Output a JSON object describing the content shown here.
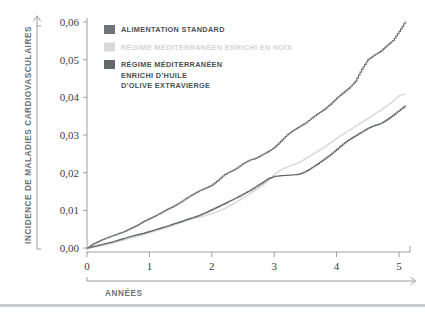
{
  "figure": {
    "background_color": "#ffffff",
    "footer_rule_color": "#c9ccd0"
  },
  "chart_data": {
    "type": "line",
    "title": "",
    "subtitle": "",
    "xlabel": "Années",
    "ylabel": "Incidence de maladies cardiovasculaires",
    "xlim": [
      0,
      5.15
    ],
    "ylim": [
      0,
      0.06
    ],
    "xticks": [
      "0",
      "1",
      "2",
      "3",
      "4",
      "5"
    ],
    "xtick_values": [
      0,
      1,
      2,
      3,
      4,
      5
    ],
    "yticks": [
      "0,00",
      "0,01",
      "0,02",
      "0,03",
      "0,04",
      "0,05",
      "0,06"
    ],
    "ytick_values": [
      0,
      0.01,
      0.02,
      0.03,
      0.04,
      0.05,
      0.06
    ],
    "grid": false,
    "legend_position": "top-left",
    "step_type": "post",
    "series": [
      {
        "name": "Alimentation standard",
        "color": "#6f7478",
        "swatch_color": "#6f7478",
        "x": [
          0,
          0.1,
          0.2,
          0.3,
          0.4,
          0.5,
          0.6,
          0.7,
          0.8,
          0.9,
          1.0,
          1.1,
          1.2,
          1.3,
          1.4,
          1.5,
          1.6,
          1.7,
          1.8,
          1.9,
          2.0,
          2.1,
          2.2,
          2.3,
          2.4,
          2.5,
          2.6,
          2.7,
          2.8,
          2.9,
          3.0,
          3.1,
          3.2,
          3.3,
          3.4,
          3.5,
          3.6,
          3.7,
          3.8,
          3.9,
          4.0,
          4.1,
          4.2,
          4.3,
          4.4,
          4.5,
          4.6,
          4.7,
          4.8,
          4.9,
          5.0,
          5.1
        ],
        "y": [
          0.0,
          0.0011,
          0.0019,
          0.0026,
          0.0032,
          0.0038,
          0.0044,
          0.0052,
          0.006,
          0.007,
          0.0078,
          0.0086,
          0.0095,
          0.0104,
          0.0112,
          0.0122,
          0.0133,
          0.0143,
          0.0152,
          0.0159,
          0.0167,
          0.018,
          0.0195,
          0.0203,
          0.0212,
          0.0224,
          0.0233,
          0.0238,
          0.0247,
          0.0256,
          0.0267,
          0.0283,
          0.03,
          0.0312,
          0.0322,
          0.0332,
          0.0345,
          0.0357,
          0.0368,
          0.0382,
          0.0398,
          0.0412,
          0.0425,
          0.0443,
          0.0475,
          0.05,
          0.0512,
          0.0522,
          0.0537,
          0.0551,
          0.0575,
          0.0602
        ]
      },
      {
        "name": "Régime méditerranéen enrichi en noix",
        "color": "#d7d9db",
        "swatch_color": "#d7d9db",
        "x": [
          0,
          0.1,
          0.2,
          0.3,
          0.4,
          0.5,
          0.6,
          0.7,
          0.8,
          0.9,
          1.0,
          1.1,
          1.2,
          1.3,
          1.4,
          1.5,
          1.6,
          1.7,
          1.8,
          1.9,
          2.0,
          2.1,
          2.2,
          2.3,
          2.4,
          2.5,
          2.6,
          2.7,
          2.8,
          2.9,
          3.0,
          3.1,
          3.2,
          3.3,
          3.4,
          3.5,
          3.6,
          3.7,
          3.8,
          3.9,
          4.0,
          4.1,
          4.2,
          4.3,
          4.4,
          4.5,
          4.6,
          4.7,
          4.8,
          4.9,
          5.0,
          5.1
        ],
        "y": [
          0.0,
          0.0002,
          0.0005,
          0.0009,
          0.0013,
          0.0018,
          0.0022,
          0.0027,
          0.0031,
          0.0036,
          0.0041,
          0.0046,
          0.0051,
          0.0056,
          0.0062,
          0.0068,
          0.0073,
          0.0078,
          0.0082,
          0.0087,
          0.0092,
          0.0098,
          0.0105,
          0.0114,
          0.0124,
          0.0134,
          0.0144,
          0.0155,
          0.0167,
          0.018,
          0.0196,
          0.0208,
          0.0215,
          0.0221,
          0.0228,
          0.0238,
          0.0248,
          0.0258,
          0.0268,
          0.028,
          0.0292,
          0.0303,
          0.0313,
          0.0324,
          0.0334,
          0.0345,
          0.0356,
          0.0366,
          0.0378,
          0.039,
          0.0405,
          0.041
        ]
      },
      {
        "name": "Régime méditerranéen enrichi d'huile d'olive extravierge",
        "color": "#63686d",
        "swatch_color": "#63686d",
        "x": [
          0,
          0.1,
          0.2,
          0.3,
          0.4,
          0.5,
          0.6,
          0.7,
          0.8,
          0.9,
          1.0,
          1.1,
          1.2,
          1.3,
          1.4,
          1.5,
          1.6,
          1.7,
          1.8,
          1.9,
          2.0,
          2.1,
          2.2,
          2.3,
          2.4,
          2.5,
          2.6,
          2.7,
          2.8,
          2.9,
          3.0,
          3.1,
          3.2,
          3.3,
          3.4,
          3.5,
          3.6,
          3.7,
          3.8,
          3.9,
          4.0,
          4.1,
          4.2,
          4.3,
          4.4,
          4.5,
          4.6,
          4.7,
          4.8,
          4.9,
          5.0,
          5.1
        ],
        "y": [
          0.0,
          0.0004,
          0.0008,
          0.0012,
          0.0016,
          0.0021,
          0.0026,
          0.0031,
          0.0035,
          0.0039,
          0.0044,
          0.0049,
          0.0054,
          0.0059,
          0.0065,
          0.007,
          0.0076,
          0.0081,
          0.0087,
          0.0094,
          0.0102,
          0.011,
          0.0118,
          0.0126,
          0.0134,
          0.0143,
          0.0152,
          0.0162,
          0.0173,
          0.0184,
          0.019,
          0.0192,
          0.0193,
          0.0194,
          0.0196,
          0.0203,
          0.0213,
          0.0224,
          0.0236,
          0.0248,
          0.0262,
          0.0276,
          0.0288,
          0.0298,
          0.0308,
          0.0318,
          0.0325,
          0.033,
          0.034,
          0.0352,
          0.0365,
          0.0378
        ]
      }
    ]
  },
  "legend": {
    "entries": [
      {
        "label": "Alimentation standard",
        "lines": [
          "Alimentation standard"
        ],
        "color": "#6f7478",
        "style": "dark"
      },
      {
        "label": "Régime méditerranéen enrichi en noix",
        "lines": [
          "Régime méditerranéen enrichi en noix"
        ],
        "color": "#d7d9db",
        "style": "light"
      },
      {
        "label": "Régime méditerranéen enrichi d'huile d'olive extravierge",
        "lines": [
          "Régime méditerranéen",
          "enrichi d'huile",
          "d'olive extravierge"
        ],
        "color": "#63686d",
        "style": "dark"
      }
    ]
  },
  "axes": {
    "y_title": "Incidence de maladies cardiovasculaires",
    "x_title": "Années",
    "axis_line_color": "#9a9ea3",
    "tick_color": "#9a9ea3",
    "arrow_color": "#9a9ea3"
  }
}
